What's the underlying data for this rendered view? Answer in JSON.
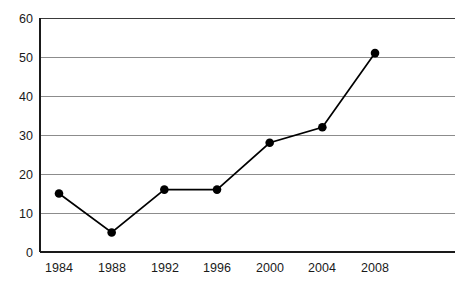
{
  "chart_data": {
    "type": "line",
    "title": "",
    "subtitle": "",
    "xlabel": "",
    "ylabel": "",
    "categories": [
      "1984",
      "1988",
      "1992",
      "1996",
      "2000",
      "2004",
      "2008"
    ],
    "x": [
      1984,
      1988,
      1992,
      1996,
      2000,
      2004,
      2008
    ],
    "values": [
      15,
      5,
      16,
      16,
      28,
      32,
      51
    ],
    "series": [
      {
        "name": "",
        "values": [
          15,
          5,
          16,
          16,
          28,
          32,
          51
        ]
      }
    ],
    "ylim": [
      0,
      60
    ],
    "yticks": [
      0,
      10,
      20,
      30,
      40,
      50,
      60
    ],
    "ytick_labels": [
      "0",
      "10",
      "20",
      "30",
      "40",
      "50",
      "60"
    ],
    "xtick_labels": [
      "1984",
      "1988",
      "1992",
      "1996",
      "2000",
      "2004",
      "2008"
    ],
    "grid": true,
    "grid_axis": "y",
    "legend": false,
    "legend_position": "none",
    "marker": "filled-circle",
    "colors": {
      "line": "#000000",
      "marker": "#000000",
      "grid": "#8c8c8c",
      "axis": "#1a1a1a",
      "background": "#ffffff",
      "tick_text": "#1a1a1a"
    },
    "annotations": []
  },
  "axes": {
    "y_axis_name": "y-axis",
    "x_axis_name": "x-axis"
  }
}
